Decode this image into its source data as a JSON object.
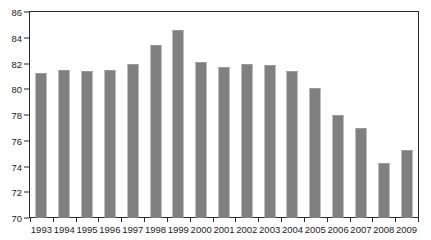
{
  "chart_data": {
    "type": "bar",
    "title": "",
    "subtitle": "",
    "xlabel": "",
    "ylabel": "",
    "ylim": [
      70,
      86
    ],
    "ytick_step": 2,
    "yticks": [
      70,
      72,
      74,
      76,
      78,
      80,
      82,
      84,
      86
    ],
    "grid": false,
    "legend": null,
    "bar_color": "#808080",
    "axis_color": "#2b2b2b",
    "categories": [
      "1993",
      "1994",
      "1995",
      "1996",
      "1997",
      "1998",
      "1999",
      "2000",
      "2001",
      "2002",
      "2003",
      "2004",
      "2005",
      "2006",
      "2007",
      "2008",
      "2009"
    ],
    "values": [
      81.3,
      81.5,
      81.4,
      81.5,
      82.0,
      83.4,
      84.6,
      82.1,
      81.7,
      82.0,
      81.9,
      81.4,
      80.1,
      78.0,
      77.0,
      74.3,
      75.3
    ],
    "series": [
      {
        "name": "value",
        "values": [
          81.3,
          81.5,
          81.4,
          81.5,
          82.0,
          83.4,
          84.6,
          82.1,
          81.7,
          82.0,
          81.9,
          81.4,
          80.1,
          78.0,
          77.0,
          74.3,
          75.3
        ]
      }
    ]
  },
  "top_caption": ""
}
